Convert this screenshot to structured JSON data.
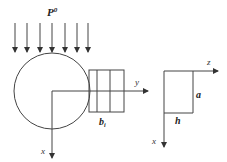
{
  "diagram": {
    "load_label": "P",
    "load_superscript": "0",
    "load_arrow_xs": [
      15,
      27,
      40,
      52,
      65,
      77,
      88
    ],
    "left_figure": {
      "circle": {
        "cx": 52,
        "cy": 91,
        "r": 38
      },
      "block_label": "b",
      "block_subscript": "i",
      "axis_y_label": "y",
      "axis_x_label": "x"
    },
    "right_figure": {
      "axis_z_label": "z",
      "axis_x_label": "x",
      "side_a_label": "a",
      "side_h_label": "h"
    },
    "colors": {
      "stroke": "#444444",
      "text": "#333333",
      "background": "#ffffff"
    }
  }
}
